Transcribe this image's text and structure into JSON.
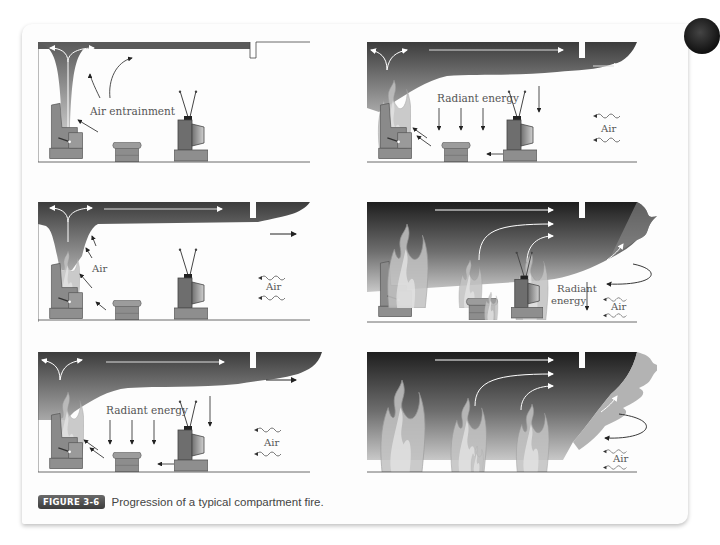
{
  "figure": {
    "badge": "FIGURE 3-6",
    "caption": "Progression of a typical compartment fire."
  },
  "panels": [
    {
      "id": 1,
      "stage": "plume",
      "labels": {
        "air_entrainment": "Air entrainment"
      }
    },
    {
      "id": 2,
      "stage": "hot-gas-layer-radiant",
      "labels": {
        "radiant": "Radiant energy",
        "air": "Air"
      }
    },
    {
      "id": 3,
      "stage": "ceiling-jet",
      "labels": {
        "air_left": "Air",
        "air_right": "Air"
      }
    },
    {
      "id": 4,
      "stage": "flashover",
      "labels": {
        "radiant_line1": "Radiant",
        "radiant_line2": "energy",
        "air": "Air"
      }
    },
    {
      "id": 5,
      "stage": "hot-gas-layer-radiant",
      "labels": {
        "radiant": "Radiant energy",
        "air": "Air"
      }
    },
    {
      "id": 6,
      "stage": "full-room-involvement",
      "labels": {
        "air": "Air"
      }
    }
  ],
  "colors": {
    "smoke_dark": "#3a3a3a",
    "smoke_light": "#9a9a9a",
    "furniture": "#8c8c8c",
    "flame": "#bdbdbd",
    "badge_bg": "#4a4a4a"
  }
}
